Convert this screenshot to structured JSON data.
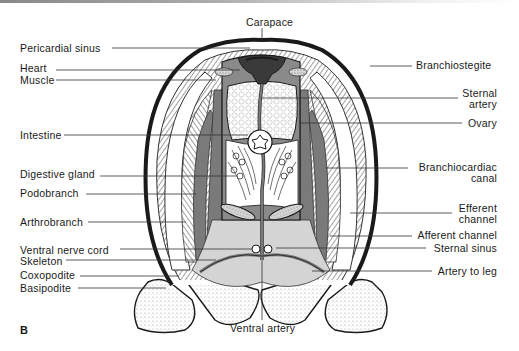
{
  "figure": {
    "panel_label": "B",
    "colors": {
      "outline": "#1a1a1a",
      "vessel_gray": "#7a7a7a",
      "sinus_gray": "#d4d4d4",
      "dark_heart": "#3a3a3a",
      "stipple": "#9a9a9a",
      "background": "#ffffff"
    }
  },
  "labels": {
    "left": [
      {
        "text": "Pericardial sinus"
      },
      {
        "text": "Heart"
      },
      {
        "text": "Muscle"
      },
      {
        "text": "Intestine"
      },
      {
        "text": "Digestive gland"
      },
      {
        "text": "Podobranch"
      },
      {
        "text": "Arthrobranch"
      },
      {
        "text": "Ventral nerve cord"
      },
      {
        "text": "Skeleton"
      },
      {
        "text": "Coxopodite"
      },
      {
        "text": "Basipodite"
      }
    ],
    "right": [
      {
        "text": "Branchiostegite"
      },
      {
        "text": "Sternal\nartery",
        "line1": "Sternal",
        "line2": "artery"
      },
      {
        "text": "Ovary"
      },
      {
        "text": "Branchiocardiac canal",
        "line1": "Branchiocardiac",
        "line2": "canal"
      },
      {
        "text": "Efferent channel",
        "line1": "Efferent",
        "line2": "channel"
      },
      {
        "text": "Afferent channel"
      },
      {
        "text": "Sternal sinus"
      },
      {
        "text": "Artery to leg"
      }
    ],
    "top": {
      "text": "Carapace"
    },
    "bottom": {
      "text": "Ventral artery"
    }
  }
}
